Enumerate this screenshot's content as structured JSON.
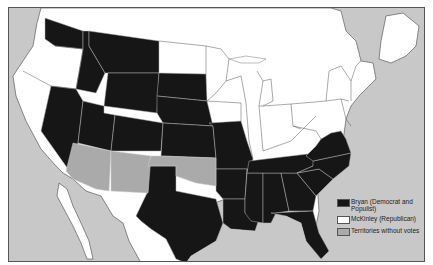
{
  "map": {
    "subject": "1896 U.S. Presidential Election results by state",
    "colors": {
      "bryan": "#161616",
      "mckinley": "#ffffff",
      "territory": "#aaaaaa",
      "water_foreign": "#c8c8c8",
      "border_light": "#b0b0b0",
      "border_dark": "#444444"
    },
    "regions": {
      "bryan_states": [
        "Washington",
        "Idaho",
        "Montana",
        "Wyoming",
        "Nevada",
        "Utah",
        "Colorado",
        "South Dakota",
        "Nebraska",
        "Kansas",
        "Missouri",
        "Texas",
        "Arkansas",
        "Louisiana",
        "Mississippi",
        "Alabama",
        "Georgia",
        "Florida",
        "Tennessee",
        "North Carolina",
        "South Carolina",
        "Virginia"
      ],
      "mckinley_states": [
        "Oregon",
        "California",
        "North Dakota",
        "Minnesota",
        "Iowa",
        "Wisconsin",
        "Illinois",
        "Michigan",
        "Indiana",
        "Ohio",
        "Kentucky",
        "West Virginia",
        "Pennsylvania",
        "New York",
        "Maryland",
        "Delaware",
        "New Jersey",
        "Connecticut",
        "Rhode Island",
        "Massachusetts",
        "Vermont",
        "New Hampshire",
        "Maine"
      ],
      "territories": [
        "Arizona Territory",
        "New Mexico Territory",
        "Oklahoma Territory / Indian Territory"
      ]
    }
  },
  "legend": {
    "items": [
      {
        "label": "Bryan (Democrat and Populist)",
        "swatch": "#161616"
      },
      {
        "label": "McKinley (Republican)",
        "swatch": "#ffffff"
      },
      {
        "label": "Territories without votes",
        "swatch": "#aaaaaa"
      }
    ]
  }
}
